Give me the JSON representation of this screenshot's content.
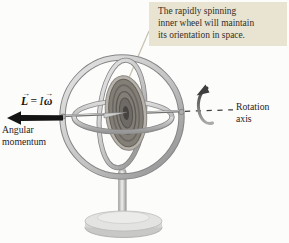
{
  "figure": {
    "callout": {
      "lines": [
        "The rapidly spinning",
        "inner wheel will maintain",
        "its orientation in space."
      ]
    },
    "momentum_equation": {
      "L": "L",
      "equals": "=",
      "I": "I",
      "omega": "ω"
    },
    "angular_momentum_label": {
      "lines": [
        "Angular",
        "momentum"
      ]
    },
    "rotation_axis_label": {
      "lines": [
        "Rotation",
        "axis"
      ]
    }
  },
  "colors": {
    "background": "#fcfcfb",
    "callout_bg": "#e9e3d1",
    "text": "#27231e",
    "momentum_arrow": "#141414",
    "leader_line": "#c9c3b3",
    "metal_light": "#e2e2e2",
    "metal_dark": "#898989",
    "wheel_disk": "#837e76",
    "wheel_rim": "#b6b1a9",
    "rotation_arrow": "#3e3e3e"
  }
}
